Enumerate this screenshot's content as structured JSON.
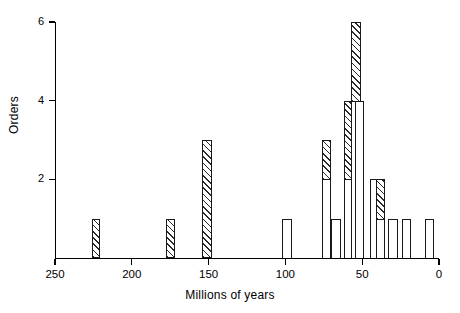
{
  "chart_data": {
    "type": "bar",
    "title": "",
    "subtitle": "",
    "xlabel": "Millions of years",
    "ylabel": "Orders",
    "xlim": [
      250,
      0
    ],
    "ylim": [
      0,
      6
    ],
    "x_axis_reversed": true,
    "grid": false,
    "legend": null,
    "xticks": [
      250,
      200,
      150,
      100,
      50,
      0
    ],
    "xtick_labels": [
      "250",
      "200",
      "150",
      "100",
      "50",
      "0"
    ],
    "yticks": [
      2,
      4,
      6
    ],
    "ytick_labels": [
      "2",
      "4",
      "6"
    ],
    "series": [
      {
        "name": "hatched",
        "fill": "hatched"
      },
      {
        "name": "open",
        "fill": "open"
      }
    ],
    "bars": [
      {
        "x_start": 226,
        "x_end": 221,
        "open": 0,
        "hatched": 1,
        "total": 1
      },
      {
        "x_start": 178,
        "x_end": 172,
        "open": 0,
        "hatched": 1,
        "total": 1
      },
      {
        "x_start": 154,
        "x_end": 148,
        "open": 0,
        "hatched": 3,
        "total": 3
      },
      {
        "x_start": 102,
        "x_end": 96,
        "open": 1,
        "hatched": 0,
        "total": 1
      },
      {
        "x_start": 76,
        "x_end": 70,
        "open": 2,
        "hatched": 1,
        "total": 3
      },
      {
        "x_start": 70,
        "x_end": 64,
        "open": 1,
        "hatched": 0,
        "total": 1
      },
      {
        "x_start": 62,
        "x_end": 56,
        "open": 2,
        "hatched": 2,
        "total": 4
      },
      {
        "x_start": 57,
        "x_end": 51,
        "open": 4,
        "hatched": 2,
        "total": 6
      },
      {
        "x_start": 55,
        "x_end": 49,
        "open": 4,
        "hatched": 0,
        "total": 4
      },
      {
        "x_start": 45,
        "x_end": 39,
        "open": 2,
        "hatched": 0,
        "total": 2
      },
      {
        "x_start": 41,
        "x_end": 35,
        "open": 1,
        "hatched": 1,
        "total": 2
      },
      {
        "x_start": 33,
        "x_end": 27,
        "open": 1,
        "hatched": 0,
        "total": 1
      },
      {
        "x_start": 24,
        "x_end": 18,
        "open": 1,
        "hatched": 0,
        "total": 1
      },
      {
        "x_start": 9,
        "x_end": 3,
        "open": 1,
        "hatched": 0,
        "total": 1
      }
    ]
  },
  "axes": {
    "xlabel": "Millions of years",
    "ylabel": "Orders"
  }
}
